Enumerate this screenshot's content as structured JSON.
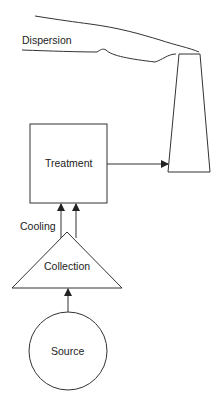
{
  "diagram": {
    "type": "process-flow",
    "nodes": {
      "source": {
        "label": "Source",
        "shape": "circle"
      },
      "collection": {
        "label": "Collection",
        "shape": "triangle"
      },
      "treatment": {
        "label": "Treatment",
        "shape": "rectangle"
      },
      "stack": {
        "label": "",
        "shape": "chimney"
      }
    },
    "annotations": {
      "cooling": "Cooling",
      "dispersion": "Dispersion"
    },
    "edges": [
      {
        "from": "source",
        "to": "collection"
      },
      {
        "from": "collection",
        "to": "treatment",
        "count": 2
      },
      {
        "from": "treatment",
        "to": "stack"
      }
    ],
    "colors": {
      "stroke": "#333333",
      "background": "#ffffff"
    }
  }
}
